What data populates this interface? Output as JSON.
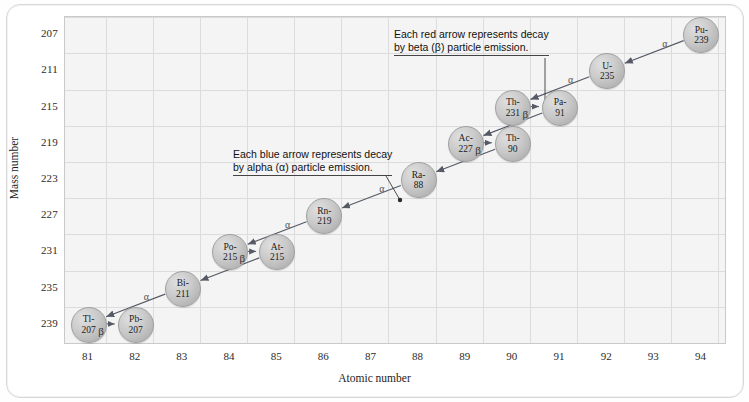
{
  "chart_data": {
    "type": "scatter",
    "title": "",
    "xlabel": "Atomic number",
    "ylabel": "Mass number",
    "xlim": [
      80.5,
      94.5
    ],
    "ylim": [
      205,
      241
    ],
    "xticks": [
      81,
      82,
      83,
      84,
      85,
      86,
      87,
      88,
      89,
      90,
      91,
      92,
      93,
      94
    ],
    "yticks": [
      207,
      211,
      215,
      219,
      223,
      227,
      231,
      235,
      239
    ],
    "grid": true,
    "legend": "none",
    "nodes": [
      {
        "label_top": "Pu-",
        "label_bottom": "239",
        "element": "Pu",
        "atomic_number": 94,
        "mass_number": 239
      },
      {
        "label_top": "U-",
        "label_bottom": "235",
        "element": "U",
        "atomic_number": 92,
        "mass_number": 235
      },
      {
        "label_top": "Th-",
        "label_bottom": "231",
        "element": "Th",
        "atomic_number": 90,
        "mass_number": 231
      },
      {
        "label_top": "Pa-",
        "label_bottom": "91",
        "element": "Pa",
        "atomic_number": 91,
        "mass_number": 231
      },
      {
        "label_top": "Ac-",
        "label_bottom": "227",
        "element": "Ac",
        "atomic_number": 89,
        "mass_number": 227
      },
      {
        "label_top": "Th-",
        "label_bottom": "90",
        "element": "Th",
        "atomic_number": 90,
        "mass_number": 227
      },
      {
        "label_top": "Ra-",
        "label_bottom": "88",
        "element": "Ra",
        "atomic_number": 88,
        "mass_number": 223
      },
      {
        "label_top": "Rn-",
        "label_bottom": "219",
        "element": "Rn",
        "atomic_number": 86,
        "mass_number": 219
      },
      {
        "label_top": "Po-",
        "label_bottom": "215",
        "element": "Po",
        "atomic_number": 84,
        "mass_number": 215
      },
      {
        "label_top": "At-",
        "label_bottom": "215",
        "element": "At",
        "atomic_number": 85,
        "mass_number": 215
      },
      {
        "label_top": "Bi-",
        "label_bottom": "211",
        "element": "Bi",
        "atomic_number": 83,
        "mass_number": 211
      },
      {
        "label_top": "Tl-",
        "label_bottom": "207",
        "element": "Tl",
        "atomic_number": 81,
        "mass_number": 207
      },
      {
        "label_top": "Pb-",
        "label_bottom": "207",
        "element": "Pb",
        "atomic_number": 82,
        "mass_number": 207
      }
    ],
    "alpha_labels": [
      "α",
      "α",
      "α",
      "α",
      "α",
      "α",
      "α",
      "α"
    ],
    "beta_labels": [
      "β",
      "β",
      "β",
      "β"
    ],
    "annotations": [
      {
        "line1": "Each red arrow represents decay",
        "line2": "by beta (β) particle emission."
      },
      {
        "line1": "Each blue arrow represents decay",
        "line2": "by alpha (α) particle emission."
      }
    ]
  },
  "axes": {
    "y_title": "Mass number",
    "x_title": "Atomic number",
    "yticks": [
      "239",
      "235",
      "231",
      "227",
      "223",
      "219",
      "215",
      "211",
      "207"
    ],
    "xticks": [
      "81",
      "82",
      "83",
      "84",
      "85",
      "86",
      "87",
      "88",
      "89",
      "90",
      "91",
      "92",
      "93",
      "94"
    ]
  },
  "nodes": {
    "pu239": {
      "top": "Pu-",
      "bottom": "239"
    },
    "u235": {
      "top": "U-",
      "bottom": "235"
    },
    "th231": {
      "top": "Th-",
      "bottom": "231"
    },
    "pa91": {
      "top": "Pa-",
      "bottom": "91"
    },
    "ac227": {
      "top": "Ac-",
      "bottom": "227"
    },
    "th90": {
      "top": "Th-",
      "bottom": "90"
    },
    "ra88": {
      "top": "Ra-",
      "bottom": "88"
    },
    "rn219": {
      "top": "Rn-",
      "bottom": "219"
    },
    "po215": {
      "top": "Po-",
      "bottom": "215"
    },
    "at215": {
      "top": "At-",
      "bottom": "215"
    },
    "bi211": {
      "top": "Bi-",
      "bottom": "211"
    },
    "tl207": {
      "top": "Tl-",
      "bottom": "207"
    },
    "pb207": {
      "top": "Pb-",
      "bottom": "207"
    }
  },
  "symbols": {
    "alpha": "α",
    "beta": "β"
  },
  "annotations": {
    "red": {
      "line1": "Each red arrow represents decay",
      "line2": "by beta (β) particle emission."
    },
    "blue": {
      "line1": "Each blue arrow represents decay",
      "line2": "by alpha (α) particle emission."
    }
  },
  "colors": {
    "node_fill": "#c9c9c9",
    "node_stroke": "#a0a0a0",
    "arrow": "#555a66",
    "grid": "#dcdcdc",
    "plot_bg": "#f4f4f4",
    "text": "#1a1a1a"
  }
}
